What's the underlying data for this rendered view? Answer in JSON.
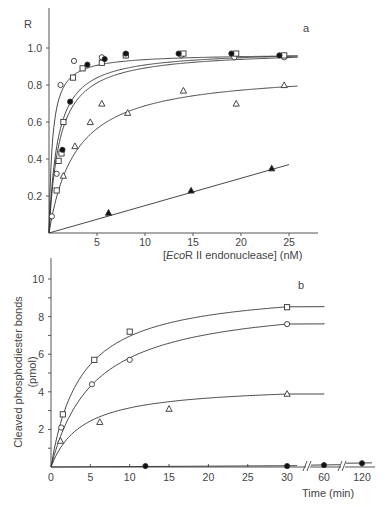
{
  "chart_data": [
    {
      "panel": "a",
      "type": "scatter",
      "title": "",
      "panel_label": "a",
      "xlabel_prefix": "[",
      "xlabel_italic": "Eco",
      "xlabel_rest": "R II endonuclease] (nM)",
      "ylabel": "R",
      "xlim": [
        0,
        28
      ],
      "ylim": [
        0,
        1.15
      ],
      "xticks": [
        5,
        10,
        15,
        20,
        25
      ],
      "xtick_labels": [
        "5",
        "10",
        "15",
        "20",
        "25"
      ],
      "yticks": [
        0.2,
        0.4,
        0.6,
        0.8,
        1.0
      ],
      "ytick_labels": [
        "0.2",
        "0.4",
        "0.6",
        "0.8",
        "1.0"
      ],
      "grid": false,
      "series": [
        {
          "name": "open circle",
          "marker": "circle-open",
          "x": [
            0.3,
            0.8,
            1.2,
            2.6,
            5.5,
            8.0,
            13.8,
            19.3,
            24.5
          ],
          "y": [
            0.09,
            0.32,
            0.8,
            0.93,
            0.95,
            0.96,
            0.96,
            0.95,
            0.95
          ],
          "fit_plateau": 0.97
        },
        {
          "name": "open square",
          "marker": "square-open",
          "x": [
            0.8,
            1.0,
            1.3,
            1.5,
            2.5,
            3.5,
            5.5,
            8.0,
            14.0,
            19.5,
            24.5
          ],
          "y": [
            0.23,
            0.39,
            0.43,
            0.6,
            0.84,
            0.89,
            0.92,
            0.96,
            0.97,
            0.97,
            0.96
          ],
          "fit_plateau": 0.97
        },
        {
          "name": "filled circle",
          "marker": "circle-filled",
          "x": [
            1.4,
            2.2,
            4.0,
            5.8,
            8.0,
            13.5,
            19.0,
            24.0
          ],
          "y": [
            0.45,
            0.71,
            0.91,
            0.94,
            0.97,
            0.97,
            0.97,
            0.96
          ],
          "fit_plateau": 0.97
        },
        {
          "name": "open triangle",
          "marker": "triangle-open",
          "x": [
            1.5,
            2.7,
            4.3,
            5.5,
            8.2,
            14.0,
            19.5,
            24.5
          ],
          "y": [
            0.31,
            0.47,
            0.6,
            0.7,
            0.65,
            0.77,
            0.7,
            0.8
          ],
          "fit_plateau": 0.82
        },
        {
          "name": "filled triangle",
          "marker": "triangle-filled",
          "x": [
            6.2,
            14.8,
            23.2
          ],
          "y": [
            0.11,
            0.23,
            0.35
          ],
          "fit": "linear"
        }
      ]
    },
    {
      "panel": "b",
      "type": "scatter",
      "title": "",
      "panel_label": "b",
      "xlabel": "Time (min)",
      "ylabel": "Cleaved phosphodiester bonds",
      "ylabel_unit": "(pmol)",
      "xlim": [
        0,
        120
      ],
      "ylim": [
        0,
        11
      ],
      "x_axis_breaks": [
        "30-60",
        "60-120"
      ],
      "xticks": [
        0,
        5,
        10,
        15,
        20,
        25,
        30,
        60,
        120
      ],
      "xtick_labels": [
        "0",
        "5",
        "10",
        "15",
        "20",
        "25",
        "30",
        "60",
        "120"
      ],
      "yticks": [
        2,
        4,
        6,
        8,
        10
      ],
      "ytick_labels": [
        "2",
        "4",
        "6",
        "8",
        "10"
      ],
      "grid": false,
      "series": [
        {
          "name": "open square",
          "marker": "square-open",
          "x": [
            1.5,
            5.5,
            10,
            30
          ],
          "y": [
            2.8,
            5.7,
            7.2,
            8.5
          ]
        },
        {
          "name": "open circle",
          "marker": "circle-open",
          "x": [
            1.3,
            5.2,
            10,
            30
          ],
          "y": [
            2.1,
            4.4,
            5.7,
            7.6
          ]
        },
        {
          "name": "open triangle",
          "marker": "triangle-open",
          "x": [
            1.2,
            6.2,
            15,
            30
          ],
          "y": [
            1.4,
            2.4,
            3.1,
            3.9
          ]
        },
        {
          "name": "filled circle",
          "marker": "circle-filled",
          "x": [
            12,
            30,
            60,
            120
          ],
          "y": [
            0.05,
            0.05,
            0.1,
            0.2
          ]
        }
      ]
    }
  ]
}
